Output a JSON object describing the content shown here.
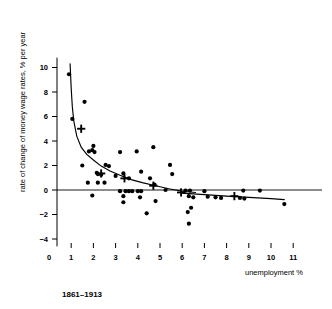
{
  "chart_data": {
    "type": "scatter",
    "title": "",
    "caption": "1861–1913",
    "xlabel": "unemployment %",
    "ylabel": "rate of change of money wage rates, % per year",
    "xlim": [
      0,
      11.6
    ],
    "ylim": [
      -4.6,
      10.8
    ],
    "xticks": [
      0,
      1,
      2,
      3,
      4,
      5,
      6,
      7,
      8,
      9,
      10,
      11
    ],
    "xticklabels": [
      "0",
      "1",
      "2",
      "3",
      "4",
      "5",
      "6",
      "7",
      "8",
      "9",
      "10",
      "11"
    ],
    "yticks": [
      -4,
      -2,
      0,
      2,
      4,
      6,
      8,
      10
    ],
    "yticklabels": [
      "−4",
      "−2",
      "0",
      "2",
      "4",
      "6",
      "8",
      "10"
    ],
    "grid": false,
    "legend": null,
    "zero_reference_line": 0,
    "series": [
      {
        "name": "annual observations",
        "marker": "filled-circle",
        "points": [
          [
            0.9,
            9.45
          ],
          [
            1.6,
            7.2
          ],
          [
            1.05,
            5.8
          ],
          [
            2.0,
            3.6
          ],
          [
            1.95,
            3.25
          ],
          [
            1.8,
            3.15
          ],
          [
            2.05,
            3.1
          ],
          [
            3.2,
            3.1
          ],
          [
            3.95,
            3.15
          ],
          [
            4.7,
            3.5
          ],
          [
            1.5,
            2.0
          ],
          [
            2.55,
            2.05
          ],
          [
            2.7,
            1.95
          ],
          [
            5.45,
            2.05
          ],
          [
            2.15,
            1.4
          ],
          [
            2.2,
            1.3
          ],
          [
            2.35,
            1.25
          ],
          [
            3.35,
            1.35
          ],
          [
            4.15,
            1.5
          ],
          [
            5.55,
            1.3
          ],
          [
            3.0,
            1.15
          ],
          [
            3.6,
            0.95
          ],
          [
            4.55,
            0.95
          ],
          [
            1.75,
            0.6
          ],
          [
            2.2,
            0.6
          ],
          [
            2.5,
            0.6
          ],
          [
            4.75,
            0.45
          ],
          [
            5.25,
            0.0
          ],
          [
            3.2,
            -0.1
          ],
          [
            3.45,
            -0.1
          ],
          [
            3.6,
            -0.1
          ],
          [
            3.75,
            -0.1
          ],
          [
            4.0,
            -0.1
          ],
          [
            4.15,
            -0.1
          ],
          [
            6.15,
            -0.05
          ],
          [
            6.35,
            -0.05
          ],
          [
            7.0,
            -0.1
          ],
          [
            8.75,
            -0.05
          ],
          [
            9.5,
            -0.05
          ],
          [
            1.95,
            -0.45
          ],
          [
            3.35,
            -0.5
          ],
          [
            4.1,
            -0.6
          ],
          [
            6.3,
            -0.5
          ],
          [
            6.5,
            -0.6
          ],
          [
            7.15,
            -0.55
          ],
          [
            7.5,
            -0.6
          ],
          [
            7.75,
            -0.65
          ],
          [
            8.6,
            -0.65
          ],
          [
            8.8,
            -0.7
          ],
          [
            3.35,
            -1.0
          ],
          [
            4.8,
            -0.9
          ],
          [
            6.4,
            -1.45
          ],
          [
            6.25,
            -1.8
          ],
          [
            4.4,
            -1.9
          ],
          [
            6.3,
            -2.75
          ],
          [
            10.6,
            -1.15
          ]
        ]
      },
      {
        "name": "group averages",
        "marker": "plus-cross",
        "points": [
          [
            1.45,
            5.0
          ],
          [
            2.35,
            1.35
          ],
          [
            3.4,
            0.95
          ],
          [
            4.7,
            0.35
          ],
          [
            5.95,
            -0.2
          ],
          [
            8.35,
            -0.5
          ]
        ]
      }
    ],
    "fitted_curve": {
      "name": "Phillips curve fit",
      "points": [
        [
          0.95,
          10.3
        ],
        [
          1.0,
          8.3
        ],
        [
          1.05,
          6.8
        ],
        [
          1.12,
          5.6
        ],
        [
          1.25,
          4.4
        ],
        [
          1.45,
          3.5
        ],
        [
          1.7,
          2.9
        ],
        [
          2.0,
          2.45
        ],
        [
          2.35,
          1.95
        ],
        [
          2.75,
          1.55
        ],
        [
          3.2,
          1.2
        ],
        [
          3.7,
          0.85
        ],
        [
          4.2,
          0.6
        ],
        [
          4.8,
          0.35
        ],
        [
          5.4,
          0.1
        ],
        [
          6.0,
          -0.1
        ],
        [
          6.6,
          -0.2
        ]
      ]
    },
    "fitted_curve_tail": {
      "name": "lower right branch",
      "points": [
        [
          6.0,
          -0.25
        ],
        [
          7.0,
          -0.38
        ],
        [
          8.0,
          -0.5
        ],
        [
          9.0,
          -0.6
        ],
        [
          10.0,
          -0.7
        ],
        [
          10.6,
          -0.78
        ]
      ]
    }
  },
  "labels": {
    "y_axis_title": "rate of change of money wage rates, % per year",
    "x_axis_title": "unemployment %",
    "caption": "1861–1913"
  },
  "colors": {
    "ink": "#000000",
    "background": "#ffffff"
  }
}
